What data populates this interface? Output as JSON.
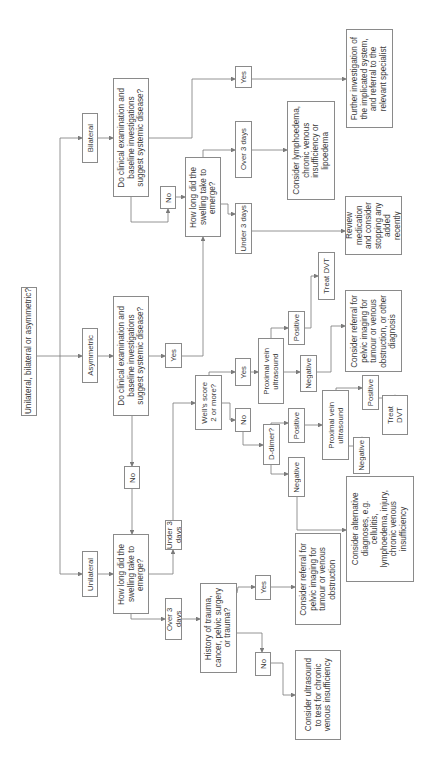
{
  "diagram": {
    "orientation": "rotated 90 degrees counter-clockwise",
    "colors": {
      "line": "#7a7a7a",
      "border": "#8a8a8a",
      "text": "#3a3a3a",
      "background": "#ffffff"
    },
    "nodes": {
      "root": "Unilateral, bilateral or asymmetric?",
      "bilateral": "Bilateral",
      "asymmetric": "Asymmetric",
      "unilateral": "Unilateral",
      "bil_systemic": "Do clinical examination and\nbaseline investigations\nsuggest systemic disease?",
      "asym_systemic": "Do clinical examination and\nbaseline investigations\nsuggest systemic disease?",
      "bil_no": "No",
      "asym_yes": "Yes",
      "asym_no": "No",
      "uni_how_long": "How long did the\nswelling take to\nemerge?",
      "bil_how_long": "How long did the\nswelling take to\nemerge?",
      "uni_under3": "Under 3 days",
      "uni_over3": "Over 3 days",
      "wells": "Well's score\n2 or more?",
      "history": "History of trauma,\ncancer, pelvic surgery\nor trauma?",
      "hist_yes": "Yes",
      "hist_no": "No",
      "hist_referral": "Consider referral for\npelvic imaging for\ntumour or venous\nobstruction",
      "hist_ultrasound": "Consider ultrasound\nto test for chronic\nvenous insufficiency",
      "wells_yes": "Yes",
      "wells_no": "No",
      "prox1": "Proximal vein\nultrasound",
      "ddimer": "D-dimer?",
      "prox1_pos": "Positive",
      "prox1_neg": "Negative",
      "treat1": "Treat DVT",
      "referral_other": "Consider referral for\npelvic imaging for\ntumour or venous\nobstruction, or other\ndiagnosis",
      "dd_pos": "Positive",
      "dd_neg": "Negative",
      "prox2": "Proximal vein\nultrasound",
      "prox2_pos": "Positive",
      "prox2_neg": "Negative",
      "treat2": "Treat\nDVT",
      "alternative": "Consider alternative\ndiagnoses, e.g.\ncellulitis,\nlymphoedema, injury,\nchronic venous\ninsufficiency",
      "bil_under3": "Under 3 days",
      "bil_over3": "Over 3 days",
      "bil_yes": "Yes",
      "lymphoedema": "Consider lymphoedema,\nchronic venous\ninsufficiency or\nlipoedema",
      "review": "Review medication\nand consider\nstopping any added\nrecently",
      "further": "Further investigation of\nthe implicated system,\nand referral to the\nrelevant specialist"
    }
  }
}
